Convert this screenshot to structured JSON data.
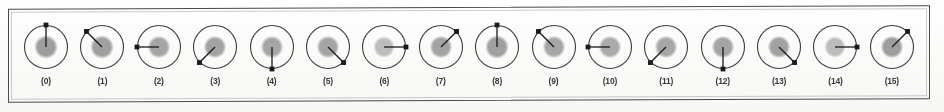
{
  "figure": {
    "name": "rotating-direction-vector-panel",
    "panel_border_color": "#4b4b4b",
    "background_color": "#fdfdfc",
    "outer_circle_color": "#3d3d3d",
    "inner_blob_color": "#a8a8a8",
    "arrow_color": "#1a1a1a",
    "label_color": "#3a3a3a",
    "cell_count": 16,
    "cells": [
      {
        "label": "(0)",
        "index": 0,
        "angle_deg": 90,
        "arrow_length": 22,
        "blob_radius": 11.5,
        "blob_shade": "#9e9e9e",
        "outer_radius": 21.5
      },
      {
        "label": "(1)",
        "index": 1,
        "angle_deg": 135,
        "arrow_length": 22,
        "blob_radius": 11.5,
        "blob_shade": "#a0a0a0",
        "outer_radius": 21.5
      },
      {
        "label": "(2)",
        "index": 2,
        "angle_deg": 180,
        "arrow_length": 22,
        "blob_radius": 11.0,
        "blob_shade": "#a5a5a5",
        "outer_radius": 21.5
      },
      {
        "label": "(3)",
        "index": 3,
        "angle_deg": 225,
        "arrow_length": 22,
        "blob_radius": 11.0,
        "blob_shade": "#a2a2a2",
        "outer_radius": 21.5
      },
      {
        "label": "(4)",
        "index": 4,
        "angle_deg": 270,
        "arrow_length": 22,
        "blob_radius": 11.0,
        "blob_shade": "#a6a6a6",
        "outer_radius": 21.5
      },
      {
        "label": "(5)",
        "index": 5,
        "angle_deg": 315,
        "arrow_length": 22,
        "blob_radius": 11.0,
        "blob_shade": "#a4a4a4",
        "outer_radius": 21.5
      },
      {
        "label": "(6)",
        "index": 6,
        "angle_deg": 0,
        "arrow_length": 22,
        "blob_radius": 10.5,
        "blob_shade": "#bdbdbd",
        "outer_radius": 21.5
      },
      {
        "label": "(7)",
        "index": 7,
        "angle_deg": 45,
        "arrow_length": 22,
        "blob_radius": 11.0,
        "blob_shade": "#a3a3a3",
        "outer_radius": 21.5
      },
      {
        "label": "(8)",
        "index": 8,
        "angle_deg": 90,
        "arrow_length": 22,
        "blob_radius": 11.5,
        "blob_shade": "#9f9f9f",
        "outer_radius": 21.5
      },
      {
        "label": "(9)",
        "index": 9,
        "angle_deg": 135,
        "arrow_length": 22,
        "blob_radius": 11.0,
        "blob_shade": "#a6a6a6",
        "outer_radius": 21.5
      },
      {
        "label": "(10)",
        "index": 10,
        "angle_deg": 180,
        "arrow_length": 22,
        "blob_radius": 11.0,
        "blob_shade": "#aaaaaa",
        "outer_radius": 21.5
      },
      {
        "label": "(11)",
        "index": 11,
        "angle_deg": 225,
        "arrow_length": 22,
        "blob_radius": 11.0,
        "blob_shade": "#a7a7a7",
        "outer_radius": 21.5
      },
      {
        "label": "(12)",
        "index": 12,
        "angle_deg": 270,
        "arrow_length": 22,
        "blob_radius": 11.0,
        "blob_shade": "#a4a4a4",
        "outer_radius": 21.5
      },
      {
        "label": "(13)",
        "index": 13,
        "angle_deg": 315,
        "arrow_length": 22,
        "blob_radius": 11.0,
        "blob_shade": "#a1a1a1",
        "outer_radius": 21.5
      },
      {
        "label": "(14)",
        "index": 14,
        "angle_deg": 0,
        "arrow_length": 22,
        "blob_radius": 10.5,
        "blob_shade": "#bcbcbc",
        "outer_radius": 21.5
      },
      {
        "label": "(15)",
        "index": 15,
        "angle_deg": 45,
        "arrow_length": 22,
        "blob_radius": 11.0,
        "blob_shade": "#9d9d9d",
        "outer_radius": 21.5
      }
    ]
  }
}
